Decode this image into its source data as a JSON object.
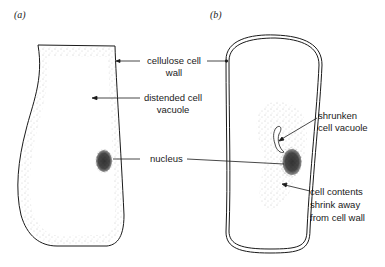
{
  "panels": [
    {
      "id": "a",
      "label": "(a)"
    },
    {
      "id": "b",
      "label": "(b)"
    }
  ],
  "labels": {
    "cell_wall": {
      "line1": "cellulose cell",
      "line2": "wall"
    },
    "distended_vacuole": {
      "line1": "distended cell",
      "line2": "vacuole"
    },
    "nucleus": "nucleus",
    "shrunken_vacuole": {
      "line1": "shrunken",
      "line2": "cell vacuole"
    },
    "cell_contents": {
      "line1": "cell contents",
      "line2": "shrink away",
      "line3": "from cell wall"
    }
  },
  "colors": {
    "line": "#1a1a1a",
    "stipple": "#9a9a9a",
    "nucleus": "#2a2a2a"
  }
}
